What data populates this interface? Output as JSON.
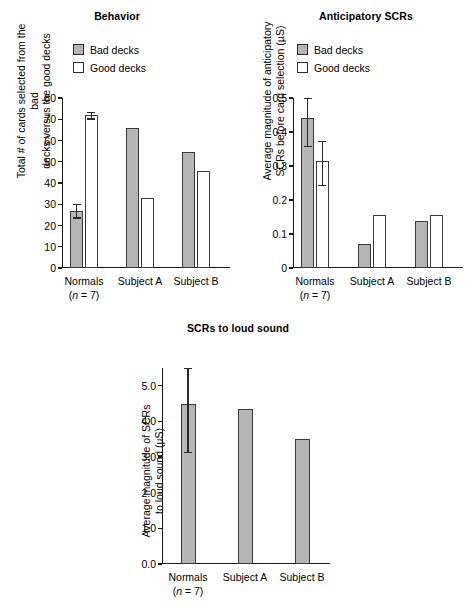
{
  "figure": {
    "legend": {
      "bad_label": "Bad decks",
      "good_label": "Good decks"
    },
    "group_labels": [
      "Normals",
      "Subject A",
      "Subject B"
    ],
    "normals_n": "(n = 7)",
    "colors": {
      "bad_fill": "#b5b5b5",
      "good_fill": "#ffffff",
      "outline": "#3a3a3a",
      "axis": "#1a1a1a"
    }
  },
  "chart_data": [
    {
      "type": "bar",
      "title": "Behavior",
      "ylabel": "Total # of cards selected from the bad\ndecks versus the good decks",
      "xlabel": "",
      "categories": [
        "Normals",
        "Subject A",
        "Subject B"
      ],
      "ylim": [
        0,
        80
      ],
      "yticks": [
        0,
        10,
        20,
        30,
        40,
        50,
        60,
        70,
        80
      ],
      "ytick_labels": [
        "0",
        "10",
        "20",
        "30",
        "40",
        "50",
        "60",
        "70",
        "80"
      ],
      "grid": false,
      "legend_position": "above-left",
      "series": [
        {
          "name": "Bad decks",
          "values": [
            27.0,
            66.0,
            54.5
          ],
          "errors_low": [
            23.8,
            null,
            null
          ],
          "errors_high": [
            30.2,
            null,
            null
          ]
        },
        {
          "name": "Good decks",
          "values": [
            72.0,
            32.8,
            45.5
          ],
          "errors_low": [
            70.4,
            null,
            null
          ],
          "errors_high": [
            73.3,
            null,
            null
          ]
        }
      ]
    },
    {
      "type": "bar",
      "title": "Anticipatory SCRs",
      "ylabel": "Average magnitude of anticipatory\nSCRs before card selection (µS)",
      "xlabel": "",
      "categories": [
        "Normals",
        "Subject A",
        "Subject B"
      ],
      "ylim": [
        0,
        0.5
      ],
      "yticks": [
        0,
        0.1,
        0.2,
        0.3,
        0.4,
        0.5
      ],
      "ytick_labels": [
        "0",
        "0.1",
        "0.2",
        "0.3",
        "0.4",
        "0.5"
      ],
      "grid": false,
      "legend_position": "above-left",
      "series": [
        {
          "name": "Bad decks",
          "values": [
            0.44,
            0.071,
            0.137
          ],
          "errors_low": [
            0.36,
            null,
            null
          ],
          "errors_high": [
            0.515,
            null,
            null
          ]
        },
        {
          "name": "Good decks",
          "values": [
            0.315,
            0.155,
            0.155
          ],
          "errors_low": [
            0.245,
            null,
            null
          ],
          "errors_high": [
            0.375,
            null,
            null
          ]
        }
      ]
    },
    {
      "type": "bar",
      "title": "SCRs to loud sound",
      "ylabel": "Average magnitude of SCRs\nto loud sound (µS)",
      "xlabel": "",
      "categories": [
        "Normals",
        "Subject A",
        "Subject B"
      ],
      "ylim": [
        0,
        5.5
      ],
      "yticks": [
        0,
        1.0,
        2.0,
        3.0,
        4.0,
        5.0
      ],
      "ytick_labels": [
        "0.0",
        "1.0",
        "2.0",
        "3.0",
        "4.0",
        "5.0"
      ],
      "grid": false,
      "legend_position": "none",
      "series": [
        {
          "name": "SCR",
          "values": [
            4.5,
            4.35,
            3.52
          ],
          "errors_low": [
            3.15,
            null,
            null
          ],
          "errors_high": [
            5.52,
            null,
            null
          ]
        }
      ]
    }
  ]
}
